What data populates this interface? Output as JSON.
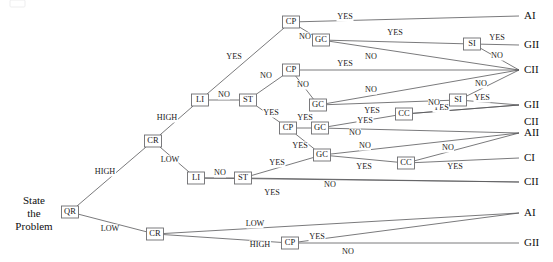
{
  "diagram": {
    "root_label_lines": [
      "State",
      "the",
      "Problem"
    ],
    "edge_colour": "#58585a",
    "node_border_colour": "#6d6d70",
    "node_fill_colour": "#ffffff",
    "text_colour": "#101010"
  },
  "nodes": [
    {
      "id": "n_qr",
      "label": "QR",
      "x": 70,
      "y": 212
    },
    {
      "id": "n_cr_hi",
      "label": "CR",
      "x": 153,
      "y": 141
    },
    {
      "id": "n_cr_lo",
      "label": "CR",
      "x": 155,
      "y": 234
    },
    {
      "id": "n_li_hi",
      "label": "LI",
      "x": 200,
      "y": 100
    },
    {
      "id": "n_st_hi",
      "label": "ST",
      "x": 248,
      "y": 100
    },
    {
      "id": "n_li_lo",
      "label": "LI",
      "x": 196,
      "y": 178
    },
    {
      "id": "n_st_lo",
      "label": "ST",
      "x": 243,
      "y": 178
    },
    {
      "id": "n_cp_1",
      "label": "CP",
      "x": 291,
      "y": 22
    },
    {
      "id": "n_cp_2",
      "label": "CP",
      "x": 291,
      "y": 70
    },
    {
      "id": "n_cp_3",
      "label": "CP",
      "x": 288,
      "y": 128
    },
    {
      "id": "n_cp_4",
      "label": "CP",
      "x": 290,
      "y": 243
    },
    {
      "id": "n_gc_1",
      "label": "GC",
      "x": 321,
      "y": 40
    },
    {
      "id": "n_gc_2",
      "label": "GC",
      "x": 318,
      "y": 105
    },
    {
      "id": "n_gc_3",
      "label": "GC",
      "x": 320,
      "y": 128
    },
    {
      "id": "n_gc_4",
      "label": "GC",
      "x": 322,
      "y": 155
    },
    {
      "id": "n_si_1",
      "label": "SI",
      "x": 472,
      "y": 44
    },
    {
      "id": "n_si_2",
      "label": "SI",
      "x": 458,
      "y": 100
    },
    {
      "id": "n_cc_1",
      "label": "CC",
      "x": 404,
      "y": 114
    },
    {
      "id": "n_cc_2",
      "label": "CC",
      "x": 406,
      "y": 163
    }
  ],
  "outcomes": [
    {
      "id": "o_ai_1",
      "label": "AI",
      "x": 524,
      "y": 16
    },
    {
      "id": "o_gii_1",
      "label": "GII",
      "x": 524,
      "y": 45
    },
    {
      "id": "o_cii_1",
      "label": "CII",
      "x": 524,
      "y": 70
    },
    {
      "id": "o_gii_2",
      "label": "GII",
      "x": 524,
      "y": 105
    },
    {
      "id": "o_cii_2",
      "label": "CII",
      "x": 524,
      "y": 122
    },
    {
      "id": "o_aii_1",
      "label": "AII",
      "x": 524,
      "y": 133
    },
    {
      "id": "o_ci_1",
      "label": "CI",
      "x": 524,
      "y": 158
    },
    {
      "id": "o_cii_3",
      "label": "CII",
      "x": 524,
      "y": 182
    },
    {
      "id": "o_ai_2",
      "label": "AI",
      "x": 524,
      "y": 213
    },
    {
      "id": "o_gii_3",
      "label": "GII",
      "x": 524,
      "y": 243
    }
  ],
  "edges": [
    {
      "from": "n_qr",
      "to": "n_cr_hi",
      "label": "HIGH",
      "lx": 105,
      "ly": 172
    },
    {
      "from": "n_qr",
      "to": "n_cr_lo",
      "label": "LOW",
      "lx": 110,
      "ly": 229
    },
    {
      "from": "n_cr_hi",
      "to": "n_li_hi",
      "label": "HIGH",
      "lx": 167,
      "ly": 118
    },
    {
      "from": "n_cr_hi",
      "to": "n_li_lo",
      "label": "LOW",
      "lx": 170,
      "ly": 160
    },
    {
      "from": "n_li_hi",
      "to": "n_st_hi",
      "label": "NO",
      "lx": 224,
      "ly": 95
    },
    {
      "from": "n_li_hi",
      "to": "n_cp_1",
      "label": "YES",
      "lx": 234,
      "ly": 57
    },
    {
      "from": "n_st_hi",
      "to": "n_cp_2",
      "label": "NO",
      "lx": 266,
      "ly": 76
    },
    {
      "from": "n_st_hi",
      "to": "n_cp_3",
      "label": "YES",
      "lx": 271,
      "ly": 113
    },
    {
      "from": "n_cp_1",
      "to": "o_ai_1",
      "label": "YES",
      "lx": 345,
      "ly": 17
    },
    {
      "from": "n_cp_1",
      "to": "n_gc_1",
      "label": "NO",
      "lx": 305,
      "ly": 37
    },
    {
      "from": "n_gc_1",
      "to": "n_si_1",
      "label": "YES",
      "lx": 395,
      "ly": 33
    },
    {
      "from": "n_gc_1",
      "to": "o_cii_1",
      "label": "NO",
      "lx": 371,
      "ly": 57
    },
    {
      "from": "n_si_1",
      "to": "o_gii_1",
      "label": "YES",
      "lx": 497,
      "ly": 38
    },
    {
      "from": "n_si_1",
      "to": "o_cii_1",
      "label": "NO",
      "lx": 497,
      "ly": 56
    },
    {
      "from": "n_cp_2",
      "to": "o_cii_1",
      "label": "YES",
      "lx": 345,
      "ly": 64
    },
    {
      "from": "n_cp_2",
      "to": "n_gc_2",
      "label": "NO",
      "lx": 303,
      "ly": 85
    },
    {
      "from": "n_gc_2",
      "to": "o_cii_1",
      "label": "NO",
      "lx": 371,
      "ly": 90
    },
    {
      "from": "n_gc_2",
      "to": "n_si_2",
      "label": "YES",
      "lx": 372,
      "ly": 111
    },
    {
      "from": "n_si_2",
      "to": "o_gii_2",
      "label": "YES",
      "lx": 482,
      "ly": 98
    },
    {
      "from": "n_si_2",
      "to": "o_cii_1",
      "label": "NO",
      "lx": 481,
      "ly": 84
    },
    {
      "from": "n_cp_3",
      "to": "n_gc_3",
      "label": "YES",
      "lx": 305,
      "ly": 118
    },
    {
      "from": "n_cp_3",
      "to": "n_gc_4",
      "label": "YES",
      "lx": 300,
      "ly": 146
    },
    {
      "from": "n_gc_3",
      "to": "n_cc_1",
      "label": "YES",
      "lx": 365,
      "ly": 121
    },
    {
      "from": "n_gc_3",
      "to": "o_aii_1",
      "label": "NO",
      "lx": 355,
      "ly": 133
    },
    {
      "from": "n_cc_1",
      "to": "o_gii_2",
      "label": "YES",
      "lx": 441,
      "ly": 108
    },
    {
      "from": "n_cc_1",
      "to": "o_gii_2",
      "label": "NO",
      "lx": 434,
      "ly": 103
    },
    {
      "from": "n_gc_4",
      "to": "n_cc_2",
      "label": "YES",
      "lx": 364,
      "ly": 167
    },
    {
      "from": "n_gc_4",
      "to": "o_aii_1",
      "label": "NO",
      "lx": 365,
      "ly": 146
    },
    {
      "from": "n_cc_2",
      "to": "o_ci_1",
      "label": "YES",
      "lx": 455,
      "ly": 167
    },
    {
      "from": "n_cc_2",
      "to": "o_aii_1",
      "label": "NO",
      "lx": 448,
      "ly": 148
    },
    {
      "from": "n_li_lo",
      "to": "n_st_lo",
      "label": "NO",
      "lx": 220,
      "ly": 173
    },
    {
      "from": "n_li_lo",
      "to": "o_cii_3",
      "label": "YES",
      "lx": 272,
      "ly": 193
    },
    {
      "from": "n_st_lo",
      "to": "n_gc_4",
      "label": "YES",
      "lx": 277,
      "ly": 163
    },
    {
      "from": "n_st_lo",
      "to": "o_cii_3",
      "label": "NO",
      "lx": 330,
      "ly": 185
    },
    {
      "from": "n_cr_lo",
      "to": "o_ai_2",
      "label": "LOW",
      "lx": 255,
      "ly": 224
    },
    {
      "from": "n_cr_lo",
      "to": "n_cp_4",
      "label": "HIGH",
      "lx": 260,
      "ly": 245
    },
    {
      "from": "n_cp_4",
      "to": "o_ai_2",
      "label": "YES",
      "lx": 317,
      "ly": 237
    },
    {
      "from": "n_cp_4",
      "to": "o_gii_3",
      "label": "NO",
      "lx": 348,
      "ly": 252
    }
  ],
  "node_legend": {
    "QR": "Quality Requirement",
    "CR": "Commitment Requirement",
    "LI": "Leader's Information",
    "ST": "Problem Structure",
    "CP": "Commitment Probability",
    "GC": "Goal Congruence",
    "CC": "Subordinate Conflict",
    "SI": "Subordinate Information"
  }
}
